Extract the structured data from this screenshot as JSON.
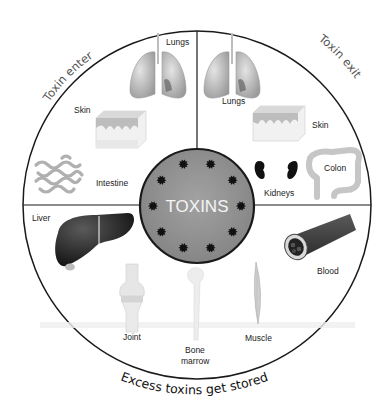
{
  "diagram": {
    "center": {
      "label": "TOXINS",
      "toxin_particle_count": 10
    },
    "sections": {
      "enter": {
        "title": "Toxin enter",
        "organs": [
          {
            "label": "Lungs"
          },
          {
            "label": "Skin"
          },
          {
            "label": "Intestine"
          }
        ]
      },
      "exit": {
        "title": "Toxin exit",
        "organs": [
          {
            "label": "Lungs"
          },
          {
            "label": "Skin"
          },
          {
            "label": "Kidneys"
          },
          {
            "label": "Colon"
          }
        ]
      },
      "stored": {
        "title": "Excess toxins get stored",
        "organs": [
          {
            "label": "Liver"
          },
          {
            "label": "Joint"
          },
          {
            "label": "Bone"
          },
          {
            "label": "marrow"
          },
          {
            "label": "Muscle"
          },
          {
            "label": "Blood"
          }
        ]
      }
    },
    "colors": {
      "outline": "#1a1a1a",
      "center_fill": "#8e8e8e",
      "particle": "#111111",
      "organ_light": "#c9c9c9",
      "organ_dark": "#2a2a2a"
    }
  }
}
